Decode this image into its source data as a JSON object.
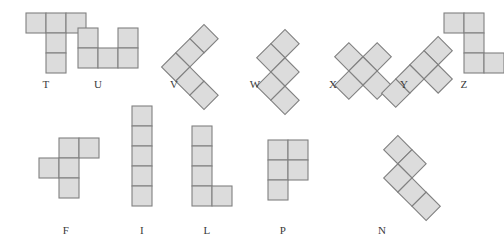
{
  "figure": {
    "title": "",
    "background_color": "#ffffff",
    "cell_fill": "#dcdcdc",
    "cell_stroke": "#808080",
    "label_color": "#3a3a3a",
    "cell_size": 20
  },
  "pentominoes": [
    {
      "name": "T",
      "label": "T",
      "row": 1,
      "rotation_deg": 0,
      "origin": {
        "x": 26,
        "y": 13
      },
      "cells": [
        [
          0,
          0
        ],
        [
          1,
          0
        ],
        [
          2,
          0
        ],
        [
          1,
          1
        ],
        [
          1,
          2
        ]
      ],
      "label_pos": {
        "x": 46,
        "y": 78
      }
    },
    {
      "name": "U",
      "label": "U",
      "row": 1,
      "rotation_deg": 0,
      "origin": {
        "x": 78,
        "y": 28
      },
      "cells": [
        [
          0,
          0
        ],
        [
          2,
          0
        ],
        [
          0,
          1
        ],
        [
          1,
          1
        ],
        [
          2,
          1
        ]
      ],
      "label_pos": {
        "x": 98,
        "y": 78
      }
    },
    {
      "name": "V",
      "label": "V",
      "row": 1,
      "rotation_deg": 45,
      "origin": {
        "x": 174,
        "y": 37
      },
      "cells": [
        [
          0,
          0
        ],
        [
          0,
          1
        ],
        [
          0,
          2
        ],
        [
          1,
          2
        ],
        [
          2,
          2
        ]
      ],
      "label_pos": {
        "x": 174,
        "y": 78
      }
    },
    {
      "name": "W",
      "label": "W",
      "row": 1,
      "rotation_deg": 45,
      "origin": {
        "x": 255,
        "y": 42
      },
      "cells": [
        [
          0,
          0
        ],
        [
          0,
          1
        ],
        [
          1,
          1
        ],
        [
          1,
          2
        ],
        [
          2,
          2
        ]
      ],
      "label_pos": {
        "x": 255,
        "y": 78
      }
    },
    {
      "name": "X",
      "label": "X",
      "row": 1,
      "rotation_deg": 45,
      "origin": {
        "x": 333,
        "y": 41
      },
      "cells": [
        [
          1,
          0
        ],
        [
          0,
          1
        ],
        [
          1,
          1
        ],
        [
          2,
          1
        ],
        [
          1,
          2
        ]
      ],
      "label_pos": {
        "x": 333,
        "y": 78
      }
    },
    {
      "name": "Y",
      "label": "Y",
      "row": 1,
      "rotation_deg": 45,
      "origin": {
        "x": 404,
        "y": 39
      },
      "cells": [
        [
          0,
          0
        ],
        [
          0,
          1
        ],
        [
          1,
          1
        ],
        [
          0,
          2
        ],
        [
          0,
          3
        ]
      ],
      "label_pos": {
        "x": 404,
        "y": 78
      }
    },
    {
      "name": "Z",
      "label": "Z",
      "row": 1,
      "rotation_deg": 0,
      "origin": {
        "x": 444,
        "y": 13
      },
      "cells": [
        [
          0,
          0
        ],
        [
          1,
          0
        ],
        [
          1,
          1
        ],
        [
          1,
          2
        ],
        [
          2,
          2
        ]
      ],
      "label_pos": {
        "x": 464,
        "y": 78
      }
    },
    {
      "name": "F",
      "label": "F",
      "row": 2,
      "rotation_deg": 0,
      "origin": {
        "x": 39,
        "y": 138
      },
      "cells": [
        [
          1,
          0
        ],
        [
          2,
          0
        ],
        [
          0,
          1
        ],
        [
          1,
          1
        ],
        [
          1,
          2
        ]
      ],
      "label_pos": {
        "x": 66,
        "y": 224
      }
    },
    {
      "name": "I",
      "label": "I",
      "row": 2,
      "rotation_deg": 0,
      "origin": {
        "x": 132,
        "y": 106
      },
      "cells": [
        [
          0,
          0
        ],
        [
          0,
          1
        ],
        [
          0,
          2
        ],
        [
          0,
          3
        ],
        [
          0,
          4
        ]
      ],
      "label_pos": {
        "x": 142,
        "y": 224
      }
    },
    {
      "name": "L",
      "label": "L",
      "row": 2,
      "rotation_deg": 0,
      "origin": {
        "x": 192,
        "y": 126
      },
      "cells": [
        [
          0,
          0
        ],
        [
          0,
          1
        ],
        [
          0,
          2
        ],
        [
          0,
          3
        ],
        [
          1,
          3
        ]
      ],
      "label_pos": {
        "x": 207,
        "y": 224
      }
    },
    {
      "name": "P",
      "label": "P",
      "row": 2,
      "rotation_deg": 0,
      "origin": {
        "x": 268,
        "y": 140
      },
      "cells": [
        [
          0,
          0
        ],
        [
          1,
          0
        ],
        [
          0,
          1
        ],
        [
          1,
          1
        ],
        [
          0,
          2
        ]
      ],
      "label_pos": {
        "x": 283,
        "y": 224
      }
    },
    {
      "name": "N",
      "label": "N",
      "row": 2,
      "rotation_deg": 45,
      "origin": {
        "x": 372,
        "y": 158
      },
      "cells": [
        [
          0,
          0
        ],
        [
          1,
          0
        ],
        [
          1,
          1
        ],
        [
          2,
          1
        ],
        [
          3,
          1
        ]
      ],
      "label_pos": {
        "x": 382,
        "y": 224
      }
    }
  ]
}
